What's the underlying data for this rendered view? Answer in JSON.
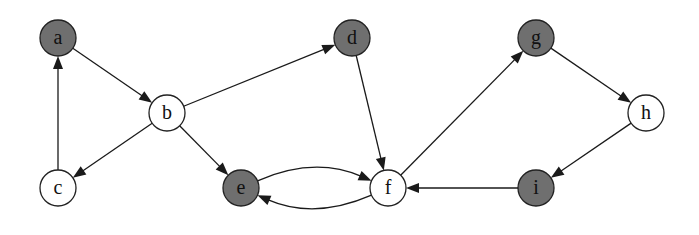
{
  "diagram": {
    "type": "directed-graph",
    "node_radius": 18,
    "colors": {
      "shaded_fill": "#6f6f6f",
      "plain_fill": "#ffffff",
      "stroke": "#222222",
      "edge": "#1a1a1a"
    },
    "nodes": [
      {
        "id": "a",
        "label": "a",
        "x": 58,
        "y": 38,
        "shaded": true
      },
      {
        "id": "b",
        "label": "b",
        "x": 167,
        "y": 113,
        "shaded": false
      },
      {
        "id": "c",
        "label": "c",
        "x": 58,
        "y": 188,
        "shaded": false
      },
      {
        "id": "d",
        "label": "d",
        "x": 352,
        "y": 38,
        "shaded": true
      },
      {
        "id": "e",
        "label": "e",
        "x": 241,
        "y": 188,
        "shaded": true
      },
      {
        "id": "f",
        "label": "f",
        "x": 388,
        "y": 188,
        "shaded": false
      },
      {
        "id": "g",
        "label": "g",
        "x": 536,
        "y": 38,
        "shaded": true
      },
      {
        "id": "h",
        "label": "h",
        "x": 646,
        "y": 113,
        "shaded": false
      },
      {
        "id": "i",
        "label": "i",
        "x": 536,
        "y": 188,
        "shaded": true
      }
    ],
    "edges": [
      {
        "from": "a",
        "to": "b",
        "curve": 0
      },
      {
        "from": "c",
        "to": "a",
        "curve": 0
      },
      {
        "from": "b",
        "to": "c",
        "curve": 0
      },
      {
        "from": "b",
        "to": "d",
        "curve": 0
      },
      {
        "from": "b",
        "to": "e",
        "curve": 0
      },
      {
        "from": "d",
        "to": "f",
        "curve": 0
      },
      {
        "from": "e",
        "to": "f",
        "curve": -32
      },
      {
        "from": "f",
        "to": "e",
        "curve": -32
      },
      {
        "from": "f",
        "to": "g",
        "curve": 0
      },
      {
        "from": "g",
        "to": "h",
        "curve": 0
      },
      {
        "from": "h",
        "to": "i",
        "curve": 0
      },
      {
        "from": "i",
        "to": "f",
        "curve": 0
      }
    ]
  }
}
